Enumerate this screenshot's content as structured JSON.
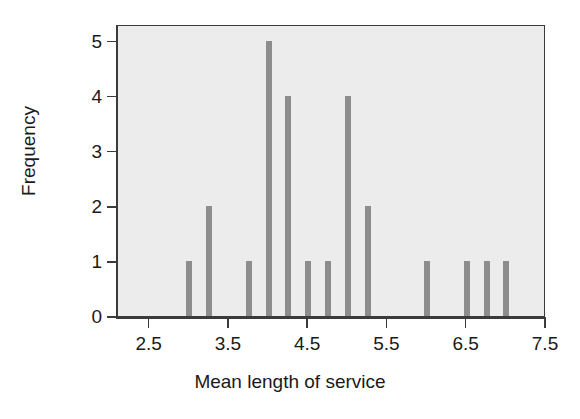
{
  "chart_data": {
    "type": "bar",
    "title": "",
    "xlabel": "Mean length of service",
    "ylabel": "Frequency",
    "xlim": [
      2.1,
      7.5
    ],
    "ylim": [
      0,
      5.3
    ],
    "xticks": [
      2.5,
      3.5,
      4.5,
      5.5,
      6.5,
      7.5
    ],
    "xtick_labels": [
      "2.5",
      "3.5",
      "4.5",
      "5.5",
      "6.5",
      "7.5"
    ],
    "yticks": [
      0,
      1,
      2,
      3,
      4,
      5
    ],
    "ytick_labels": [
      "0",
      "1",
      "2",
      "3",
      "4",
      "5"
    ],
    "grid": false,
    "legend": null,
    "bar_color": "#8d8d8d",
    "plot_background": "#ececec",
    "axis_color": "#3b3b3b",
    "bar_width_units": 0.075,
    "x": [
      3.0,
      3.25,
      3.75,
      4.0,
      4.25,
      4.5,
      4.75,
      5.0,
      5.25,
      6.0,
      6.5,
      6.75,
      7.0
    ],
    "values": [
      1,
      2,
      1,
      5,
      4,
      1,
      1,
      4,
      2,
      1,
      1,
      1,
      1
    ],
    "points": [
      {
        "x": 3.0,
        "y": 1
      },
      {
        "x": 3.25,
        "y": 2
      },
      {
        "x": 3.75,
        "y": 1
      },
      {
        "x": 4.0,
        "y": 5
      },
      {
        "x": 4.25,
        "y": 4
      },
      {
        "x": 4.5,
        "y": 1
      },
      {
        "x": 4.75,
        "y": 1
      },
      {
        "x": 5.0,
        "y": 4
      },
      {
        "x": 5.25,
        "y": 2
      },
      {
        "x": 6.0,
        "y": 1
      },
      {
        "x": 6.5,
        "y": 1
      },
      {
        "x": 6.75,
        "y": 1
      },
      {
        "x": 7.0,
        "y": 1
      }
    ]
  }
}
